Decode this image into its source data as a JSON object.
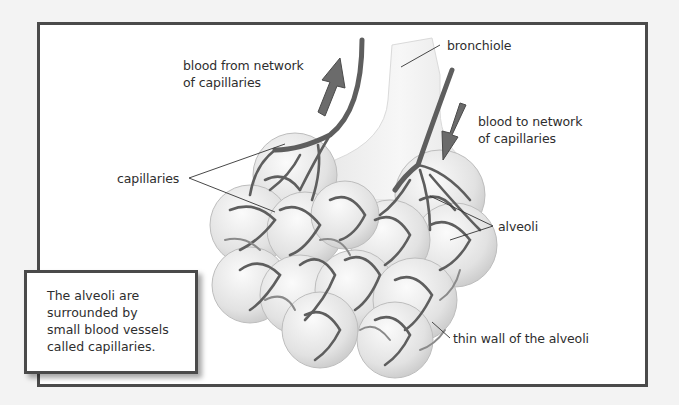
{
  "diagram": {
    "labels": {
      "blood_from": [
        "blood from network",
        "of capillaries"
      ],
      "bronchiole": "bronchiole",
      "blood_to": [
        "blood to network",
        "of capillaries"
      ],
      "capillaries": "capillaries",
      "alveoli": "alveoli",
      "thin_wall": "thin wall of the alveoli"
    },
    "caption": [
      "The alveoli are",
      "surrounded by",
      "small blood vessels",
      "called capillaries."
    ],
    "colors": {
      "background": "#f3f3f3",
      "panel": "#ffffff",
      "border": "#4a4a4a",
      "vessel": "#5e5e5e",
      "arrow": "#6b6b6b",
      "alveolus_fill": "#e4e4e4",
      "bronchiole_fill": "#f1f1f1"
    }
  }
}
